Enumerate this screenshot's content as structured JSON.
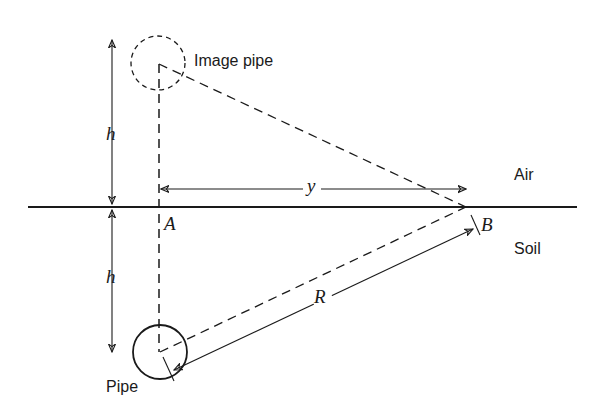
{
  "figure": {
    "type": "diagram",
    "labels": {
      "image_pipe": "Image pipe",
      "pipe": "Pipe",
      "air": "Air",
      "soil": "Soil",
      "point_a": "A",
      "point_b": "B",
      "depth_upper": "h",
      "depth_lower": "h",
      "horizontal_distance": "y",
      "radial_distance": "R"
    },
    "colors": {
      "stroke": "#1a1a1a",
      "background": "#ffffff"
    }
  }
}
